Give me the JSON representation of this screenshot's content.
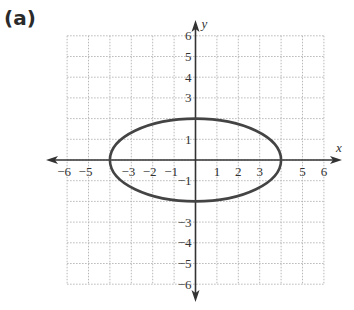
{
  "panel_label": "(a)",
  "axes": {
    "x_label": "x",
    "y_label": "y",
    "x_range": [
      -6,
      6
    ],
    "y_range": [
      -6,
      6
    ],
    "x_ticks": [
      {
        "v": -6,
        "label": "−6"
      },
      {
        "v": -5,
        "label": "−5"
      },
      {
        "v": -3,
        "label": "−3"
      },
      {
        "v": -2,
        "label": "−2"
      },
      {
        "v": -1,
        "label": "−1"
      },
      {
        "v": 1,
        "label": "1"
      },
      {
        "v": 2,
        "label": "2"
      },
      {
        "v": 3,
        "label": "3"
      },
      {
        "v": 5,
        "label": "5"
      },
      {
        "v": 6,
        "label": "6"
      }
    ],
    "y_ticks": [
      {
        "v": 6,
        "label": "6"
      },
      {
        "v": 5,
        "label": "5"
      },
      {
        "v": 4,
        "label": "4"
      },
      {
        "v": 3,
        "label": "3"
      },
      {
        "v": 1,
        "label": "1"
      },
      {
        "v": -1,
        "label": "−1"
      },
      {
        "v": -3,
        "label": "−3"
      },
      {
        "v": -4,
        "label": "−4"
      },
      {
        "v": -5,
        "label": "−5"
      },
      {
        "v": -6,
        "label": "−6"
      }
    ],
    "grid": "dotted"
  },
  "curve": {
    "type": "ellipse",
    "center": [
      0,
      0
    ],
    "semi_x": 4,
    "semi_y": 2,
    "color": "#444444"
  },
  "colors": {
    "axis": "#333333",
    "grid": "#b8b8b8"
  }
}
